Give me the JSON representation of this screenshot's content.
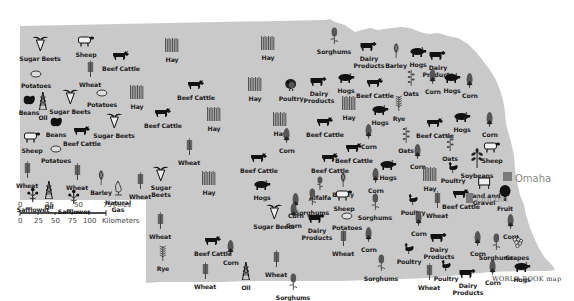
{
  "map": {
    "fill_color": "#c9c9c9",
    "credit": "WORLD BOOK map",
    "scale": {
      "miles_ticks": [
        "0",
        "25",
        "50",
        "75"
      ],
      "miles_unit": "Miles",
      "km_ticks": [
        "0",
        "25",
        "50",
        "75",
        "100"
      ],
      "km_unit": "Kilometers"
    },
    "cities": [
      {
        "name": "Omaha",
        "x": 508,
        "y": 178
      },
      {
        "name": "Lincoln",
        "x": 470,
        "y": 198
      }
    ],
    "symbols": [
      {
        "label": "Sugar Beets",
        "icon": "sugar-beet",
        "x": 40,
        "y": 35
      },
      {
        "label": "Sheep",
        "icon": "sheep",
        "x": 86,
        "y": 32
      },
      {
        "label": "Beef Cattle",
        "icon": "cattle",
        "x": 121,
        "y": 46
      },
      {
        "label": "Hay",
        "icon": "hay",
        "x": 172,
        "y": 37
      },
      {
        "label": "Hay",
        "icon": "hay",
        "x": 268,
        "y": 35
      },
      {
        "label": "Sorghums",
        "icon": "sorghum",
        "x": 334,
        "y": 27
      },
      {
        "label": "Dairy Products",
        "icon": "dairy-cow",
        "x": 369,
        "y": 37
      },
      {
        "label": "Barley",
        "icon": "barley",
        "x": 396,
        "y": 43
      },
      {
        "label": "Hogs",
        "icon": "hog",
        "x": 418,
        "y": 42
      },
      {
        "label": "Dairy Products",
        "icon": "dairy-cow",
        "x": 438,
        "y": 46
      },
      {
        "label": "Potatoes",
        "icon": "potato",
        "x": 36,
        "y": 63
      },
      {
        "label": "Wheat",
        "icon": "wheat",
        "x": 90,
        "y": 60
      },
      {
        "label": "Beef Cattle",
        "icon": "cattle",
        "x": 196,
        "y": 75
      },
      {
        "label": "Hay",
        "icon": "hay",
        "x": 255,
        "y": 76
      },
      {
        "label": "Poultry",
        "icon": "turkey",
        "x": 291,
        "y": 76
      },
      {
        "label": "Dairy Products",
        "icon": "dairy-cow",
        "x": 319,
        "y": 72
      },
      {
        "label": "Hogs",
        "icon": "hog",
        "x": 346,
        "y": 68
      },
      {
        "label": "Beef Cattle",
        "icon": "cattle",
        "x": 375,
        "y": 73
      },
      {
        "label": "Oats",
        "icon": "oats",
        "x": 411,
        "y": 69
      },
      {
        "label": "Corn",
        "icon": "corn",
        "x": 433,
        "y": 68
      },
      {
        "label": "Hogs",
        "icon": "hog",
        "x": 452,
        "y": 68
      },
      {
        "label": "Corn",
        "icon": "corn",
        "x": 470,
        "y": 72
      },
      {
        "label": "Beans",
        "icon": "bean",
        "x": 29,
        "y": 90
      },
      {
        "label": "Oil",
        "icon": "oil-derrick",
        "x": 43,
        "y": 92
      },
      {
        "label": "Sugar Beets",
        "icon": "sugar-beet",
        "x": 70,
        "y": 88
      },
      {
        "label": "Potatoes",
        "icon": "potato",
        "x": 102,
        "y": 82
      },
      {
        "label": "Hay",
        "icon": "hay",
        "x": 137,
        "y": 84
      },
      {
        "label": "Beef Cattle",
        "icon": "cattle",
        "x": 163,
        "y": 103
      },
      {
        "label": "Hay",
        "icon": "hay",
        "x": 214,
        "y": 106
      },
      {
        "label": "Hay",
        "icon": "hay",
        "x": 280,
        "y": 111
      },
      {
        "label": "Beef Cattle",
        "icon": "cattle",
        "x": 325,
        "y": 112
      },
      {
        "label": "Hay",
        "icon": "hay",
        "x": 349,
        "y": 95
      },
      {
        "label": "Hogs",
        "icon": "hog",
        "x": 380,
        "y": 100
      },
      {
        "label": "Rye",
        "icon": "rye",
        "x": 399,
        "y": 94
      },
      {
        "label": "Beans",
        "icon": "bean",
        "x": 56,
        "y": 112
      },
      {
        "label": "Beef Cattle",
        "icon": "cattle",
        "x": 82,
        "y": 121
      },
      {
        "label": "Sugar Beets",
        "icon": "sugar-beet",
        "x": 114,
        "y": 112
      },
      {
        "label": "Sheep",
        "icon": "sheep",
        "x": 32,
        "y": 128
      },
      {
        "label": "Potatoes",
        "icon": "potato",
        "x": 56,
        "y": 138
      },
      {
        "label": "Wheat",
        "icon": "wheat",
        "x": 189,
        "y": 138
      },
      {
        "label": "Corn",
        "icon": "corn",
        "x": 287,
        "y": 127
      },
      {
        "label": "Beef Cattle",
        "icon": "cattle",
        "x": 354,
        "y": 138
      },
      {
        "label": "Corn",
        "icon": "corn",
        "x": 369,
        "y": 123
      },
      {
        "label": "Beef Cattle",
        "icon": "cattle",
        "x": 435,
        "y": 113
      },
      {
        "label": "Hogs",
        "icon": "hog",
        "x": 462,
        "y": 107
      },
      {
        "label": "Corn",
        "icon": "corn",
        "x": 490,
        "y": 111
      },
      {
        "label": "Oats",
        "icon": "oats",
        "x": 406,
        "y": 126
      },
      {
        "label": "Oats",
        "icon": "oats",
        "x": 450,
        "y": 134
      },
      {
        "label": "Sheep",
        "icon": "sheep",
        "x": 492,
        "y": 138
      },
      {
        "label": "Soybeans",
        "icon": "soybean",
        "x": 477,
        "y": 148
      },
      {
        "label": "Wheat",
        "icon": "wheat",
        "x": 27,
        "y": 161
      },
      {
        "label": "Wheat",
        "icon": "wheat",
        "x": 77,
        "y": 163
      },
      {
        "label": "Barley",
        "icon": "barley",
        "x": 101,
        "y": 170
      },
      {
        "label": "Natural Gas",
        "icon": "gas-flame",
        "x": 118,
        "y": 180
      },
      {
        "label": "Wheat",
        "icon": "wheat",
        "x": 140,
        "y": 172
      },
      {
        "label": "Sugar Beets",
        "icon": "sugar-beet",
        "x": 161,
        "y": 165
      },
      {
        "label": "Oil",
        "icon": "oil-derrick",
        "x": 49,
        "y": 181
      },
      {
        "label": "Safflower",
        "icon": "safflower",
        "x": 33,
        "y": 187
      },
      {
        "label": "Safflower",
        "icon": "safflower",
        "x": 74,
        "y": 189
      },
      {
        "label": "Hay",
        "icon": "hay",
        "x": 209,
        "y": 170
      },
      {
        "label": "Beef Cattle",
        "icon": "cattle",
        "x": 259,
        "y": 148
      },
      {
        "label": "Hogs",
        "icon": "hog",
        "x": 262,
        "y": 175
      },
      {
        "label": "Beef Cattle",
        "icon": "cattle",
        "x": 330,
        "y": 148
      },
      {
        "label": "Alfalfa",
        "icon": "alfalfa",
        "x": 320,
        "y": 175
      },
      {
        "label": "Barley",
        "icon": "barley",
        "x": 343,
        "y": 172
      },
      {
        "label": "Corn",
        "icon": "corn",
        "x": 376,
        "y": 167
      },
      {
        "label": "Hogs",
        "icon": "hog",
        "x": 388,
        "y": 155
      },
      {
        "label": "Corn",
        "icon": "corn",
        "x": 418,
        "y": 143
      },
      {
        "label": "Hay",
        "icon": "hay",
        "x": 430,
        "y": 166
      },
      {
        "label": "Poultry",
        "icon": "chicken",
        "x": 453,
        "y": 158
      },
      {
        "label": "Sand and Gravel",
        "icon": "sand-gravel",
        "x": 484,
        "y": 174
      },
      {
        "label": "Sorghums",
        "icon": "sorghum",
        "x": 312,
        "y": 188
      },
      {
        "label": "Sheep",
        "icon": "sheep",
        "x": 344,
        "y": 186
      },
      {
        "label": "Sorghums",
        "icon": "sorghum",
        "x": 375,
        "y": 193
      },
      {
        "label": "Corn",
        "icon": "corn",
        "x": 296,
        "y": 192
      },
      {
        "label": "Poultry",
        "icon": "chicken",
        "x": 413,
        "y": 190
      },
      {
        "label": "Wheat",
        "icon": "wheat",
        "x": 437,
        "y": 191
      },
      {
        "label": "Beef Cattle",
        "icon": "cattle",
        "x": 461,
        "y": 184
      },
      {
        "label": "Fruit",
        "icon": "fruit-tree",
        "x": 505,
        "y": 185
      },
      {
        "label": "Beef Cattle",
        "icon": "cattle",
        "x": 213,
        "y": 231
      },
      {
        "label": "Wheat",
        "icon": "wheat",
        "x": 160,
        "y": 212
      },
      {
        "label": "Sugar Beets",
        "icon": "sugar-beet",
        "x": 274,
        "y": 203
      },
      {
        "label": "Corn",
        "icon": "corn",
        "x": 294,
        "y": 202
      },
      {
        "label": "Dairy Products",
        "icon": "dairy-cow",
        "x": 317,
        "y": 209
      },
      {
        "label": "Potatoes",
        "icon": "potato",
        "x": 347,
        "y": 205
      },
      {
        "label": "Corn",
        "icon": "corn",
        "x": 369,
        "y": 226
      },
      {
        "label": "Rye",
        "icon": "rye",
        "x": 163,
        "y": 244
      },
      {
        "label": "Corn",
        "icon": "corn",
        "x": 231,
        "y": 239
      },
      {
        "label": "Wheat",
        "icon": "wheat",
        "x": 343,
        "y": 229
      },
      {
        "label": "Wheat",
        "icon": "wheat",
        "x": 205,
        "y": 262
      },
      {
        "label": "Oil",
        "icon": "oil-derrick",
        "x": 246,
        "y": 262
      },
      {
        "label": "Wheat",
        "icon": "wheat",
        "x": 276,
        "y": 250
      },
      {
        "label": "Sorghums",
        "icon": "sorghum",
        "x": 293,
        "y": 273
      },
      {
        "label": "Sorghums",
        "icon": "sorghum",
        "x": 381,
        "y": 254
      },
      {
        "label": "Corn",
        "icon": "corn",
        "x": 419,
        "y": 210
      },
      {
        "label": "Dairy Products",
        "icon": "dairy-cow",
        "x": 439,
        "y": 228
      },
      {
        "label": "Poultry",
        "icon": "chicken",
        "x": 409,
        "y": 239
      },
      {
        "label": "Poultry",
        "icon": "chicken",
        "x": 446,
        "y": 256
      },
      {
        "label": "Wheat",
        "icon": "wheat",
        "x": 429,
        "y": 263
      },
      {
        "label": "Dairy Products",
        "icon": "dairy-cow",
        "x": 468,
        "y": 264
      },
      {
        "label": "Corn",
        "icon": "corn",
        "x": 493,
        "y": 259
      },
      {
        "label": "Corn",
        "icon": "corn",
        "x": 511,
        "y": 213
      },
      {
        "label": "Corn",
        "icon": "corn",
        "x": 478,
        "y": 230
      },
      {
        "label": "Sorghums",
        "icon": "sorghum",
        "x": 496,
        "y": 233
      },
      {
        "label": "Grapes",
        "icon": "grapes",
        "x": 517,
        "y": 235
      },
      {
        "label": "Hogs",
        "icon": "hog",
        "x": 522,
        "y": 257
      }
    ]
  }
}
